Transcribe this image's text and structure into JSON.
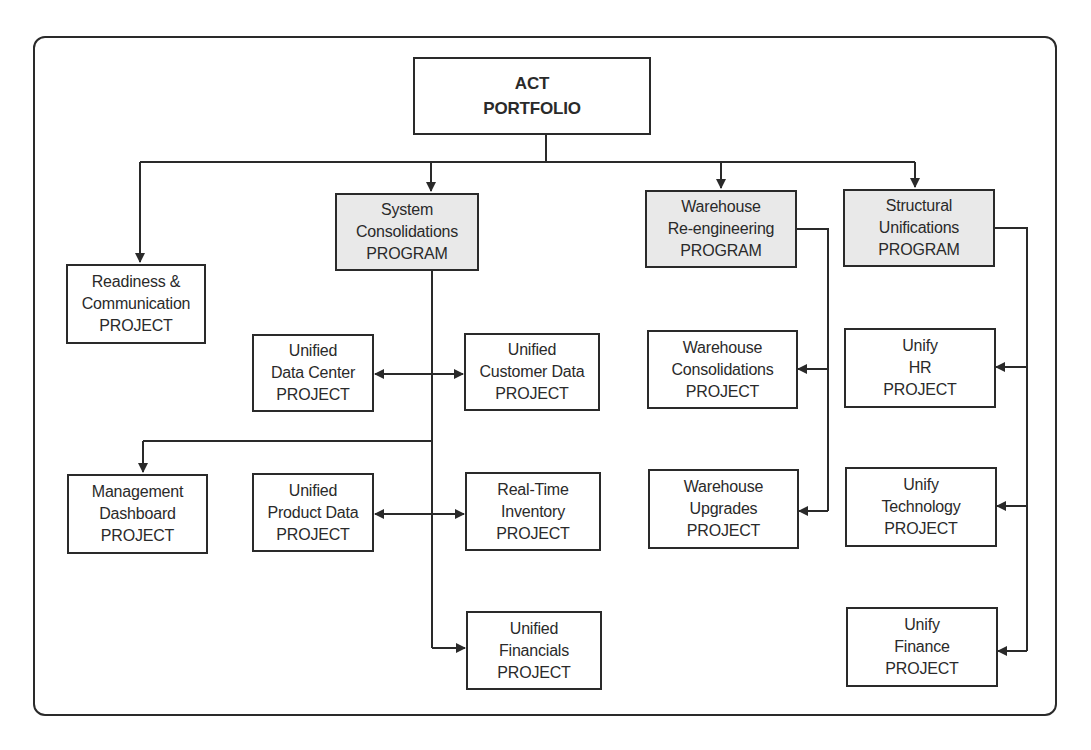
{
  "diagram": {
    "root": {
      "lines": [
        "ACT",
        "PORTFOLIO"
      ]
    },
    "programs": [
      {
        "id": "system-consolidations",
        "lines": [
          "System",
          "Consolidations",
          "PROGRAM"
        ]
      },
      {
        "id": "warehouse-reengineering",
        "lines": [
          "Warehouse",
          "Re-engineering",
          "PROGRAM"
        ]
      },
      {
        "id": "structural-unifications",
        "lines": [
          "Structural",
          "Unifications",
          "PROGRAM"
        ]
      }
    ],
    "projects": [
      {
        "id": "readiness-communication",
        "lines": [
          "Readiness &",
          "Communication",
          "PROJECT"
        ]
      },
      {
        "id": "unified-data-center",
        "lines": [
          "Unified",
          "Data Center",
          "PROJECT"
        ]
      },
      {
        "id": "unified-customer-data",
        "lines": [
          "Unified",
          "Customer Data",
          "PROJECT"
        ]
      },
      {
        "id": "management-dashboard",
        "lines": [
          "Management",
          "Dashboard",
          "PROJECT"
        ]
      },
      {
        "id": "unified-product-data",
        "lines": [
          "Unified",
          "Product Data",
          "PROJECT"
        ]
      },
      {
        "id": "real-time-inventory",
        "lines": [
          "Real-Time",
          "Inventory",
          "PROJECT"
        ]
      },
      {
        "id": "unified-financials",
        "lines": [
          "Unified",
          "Financials",
          "PROJECT"
        ]
      },
      {
        "id": "warehouse-consolidations",
        "lines": [
          "Warehouse",
          "Consolidations",
          "PROJECT"
        ]
      },
      {
        "id": "warehouse-upgrades",
        "lines": [
          "Warehouse",
          "Upgrades",
          "PROJECT"
        ]
      },
      {
        "id": "unify-hr",
        "lines": [
          "Unify",
          "HR",
          "PROJECT"
        ]
      },
      {
        "id": "unify-technology",
        "lines": [
          "Unify",
          "Technology",
          "PROJECT"
        ]
      },
      {
        "id": "unify-finance",
        "lines": [
          "Unify",
          "Finance",
          "PROJECT"
        ]
      }
    ],
    "colors": {
      "line": "#2a2a2a",
      "program_fill": "#e9e9e9",
      "project_fill": "#ffffff"
    }
  }
}
